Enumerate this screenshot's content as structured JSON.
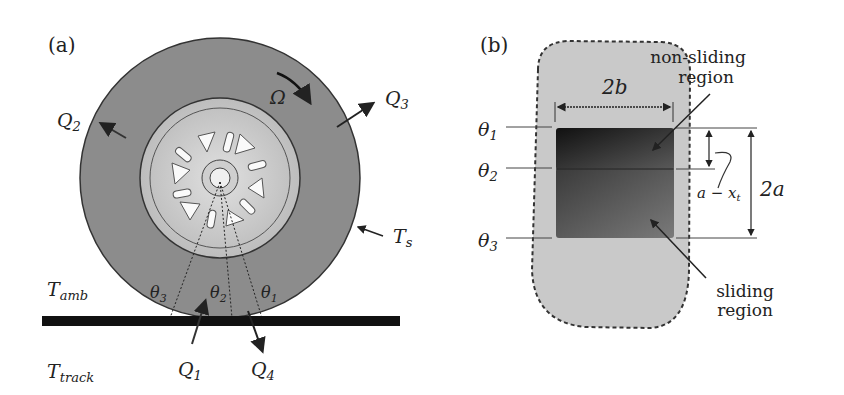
{
  "panel_a": {
    "label": "(a)",
    "omega": "Ω",
    "q1": {
      "base": "Q",
      "sub": "1"
    },
    "q2": {
      "base": "Q",
      "sub": "2"
    },
    "q3": {
      "base": "Q",
      "sub": "3"
    },
    "q4": {
      "base": "Q",
      "sub": "4"
    },
    "ts": {
      "base": "T",
      "sub": "s"
    },
    "tamb": {
      "base": "T",
      "sub": "amb"
    },
    "ttrack": {
      "base": "T",
      "sub": "track"
    },
    "theta1": {
      "base": "θ",
      "sub": "1"
    },
    "theta2": {
      "base": "θ",
      "sub": "2"
    },
    "theta3": {
      "base": "θ",
      "sub": "3"
    }
  },
  "panel_b": {
    "label": "(b)",
    "width_label": "2b",
    "height_label": "2a",
    "offset_label": "a − x",
    "offset_sub": "t",
    "non_sliding_line1": "non-sliding",
    "non_sliding_line2": "region",
    "sliding_line1": "sliding",
    "sliding_line2": "region",
    "theta1": {
      "base": "θ",
      "sub": "1"
    },
    "theta2": {
      "base": "θ",
      "sub": "2"
    },
    "theta3": {
      "base": "θ",
      "sub": "3"
    }
  },
  "colors": {
    "tire": "#8a8a8a",
    "rim": "#c8c8c8",
    "contact_patch": "#c9c9c9",
    "non_sliding": "#2a2a2a",
    "sliding": "#555555",
    "track": "#111111"
  }
}
